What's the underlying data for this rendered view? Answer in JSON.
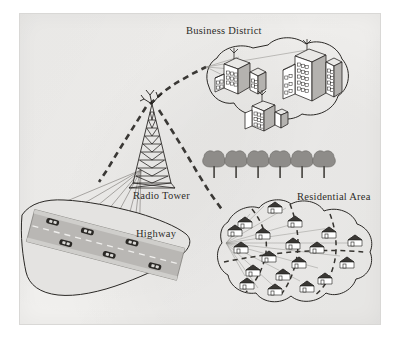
{
  "diagram": {
    "background_color": "#f1f0ee",
    "ink_color": "#1d1b19",
    "labels": [
      {
        "id": "business",
        "text": "Business District"
      },
      {
        "id": "radio_tower",
        "text": "Radio Tower"
      },
      {
        "id": "highway",
        "text": "Highway"
      },
      {
        "id": "residential",
        "text": "Residential Area"
      }
    ],
    "nodes": {
      "radio_tower": {
        "name": "Radio Tower",
        "type": "lattice-mast",
        "segments": 9,
        "antennas": 3
      },
      "business_district": {
        "name": "Business District",
        "shape": "two-lobe cloud",
        "building_clusters": 3,
        "rooftop_antennas": 3,
        "buildings": [
          {
            "id": "b1",
            "position": "upper-left",
            "floors": 5,
            "window_cols": 4
          },
          {
            "id": "b2",
            "position": "right-large",
            "floors": 6,
            "window_cols": 4
          },
          {
            "id": "b3",
            "position": "lower-mid",
            "floors": 4,
            "window_cols": 4
          }
        ]
      },
      "residential_area": {
        "name": "Residential Area",
        "shape": "lobed cloud",
        "house_count": 19,
        "interior_roads": "dashed",
        "signal_fan_origin": "west edge"
      },
      "highway": {
        "name": "Highway",
        "shape": "tilted band over land outline",
        "lanes": 2,
        "center_line": "dashed",
        "car_count": 6
      },
      "tree_row": {
        "name": "Tree row",
        "tree_count": 6
      }
    },
    "links": [
      {
        "id": "tower-business",
        "from": "radio_tower",
        "to": "business_district",
        "style": "heavy-dashed"
      },
      {
        "id": "tower-residential",
        "from": "radio_tower",
        "to": "residential_area",
        "style": "heavy-dashed"
      },
      {
        "id": "tower-highway",
        "from": "radio_tower",
        "to": "highway",
        "style": "thin-fan"
      },
      {
        "id": "business-internal",
        "from": "business_district",
        "to": "business_district",
        "style": "thin-fan"
      },
      {
        "id": "residential-internal",
        "from": "residential_area",
        "to": "residential_area",
        "style": "thin-fan"
      }
    ]
  }
}
